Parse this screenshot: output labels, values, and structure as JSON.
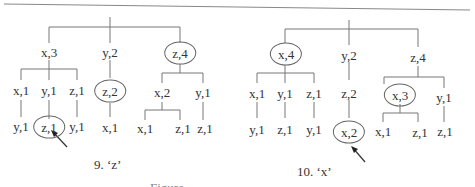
{
  "figure": {
    "caption_partial": "Figure ...",
    "panels": [
      {
        "id": "panel-9",
        "caption": "9. ‘z’",
        "root_children": [
          {
            "label": "x,3",
            "circled": false,
            "children": [
              {
                "label": "x,1",
                "children": [
                  {
                    "label": "y,1"
                  }
                ]
              },
              {
                "label": "y,1",
                "children": [
                  {
                    "label": "z,1",
                    "circled": true,
                    "arrow": true
                  }
                ]
              },
              {
                "label": "z,1",
                "children": [
                  {
                    "label": "y,1"
                  }
                ]
              }
            ]
          },
          {
            "label": "y,2",
            "circled": false,
            "children": [
              {
                "label": "z,2",
                "circled": true,
                "children": [
                  {
                    "label": "x,1"
                  }
                ]
              }
            ]
          },
          {
            "label": "z,4",
            "circled": true,
            "children": [
              {
                "label": "x,2",
                "children": [
                  {
                    "label": "x,1"
                  },
                  {
                    "label": "z,1"
                  }
                ]
              },
              {
                "label": "y,1",
                "children": [
                  {
                    "label": "z,1"
                  }
                ]
              }
            ]
          }
        ],
        "nodes": {
          "x3": "x,3",
          "y2": "y,2",
          "z4": "z,4",
          "x1a": "x,1",
          "y1a": "y,1",
          "z1a": "z,1",
          "z2": "z,2",
          "x2": "x,2",
          "y1b": "y,1",
          "y1c": "y,1",
          "z1b": "z,1",
          "y1d": "y,1",
          "x1b": "x,1",
          "x1c": "x,1",
          "z1c": "z,1",
          "z1d": "z,1"
        }
      },
      {
        "id": "panel-10",
        "caption": "10. ‘x’",
        "root_children": [
          {
            "label": "x,4",
            "circled": true,
            "children": [
              {
                "label": "x,1",
                "children": [
                  {
                    "label": "y,1"
                  }
                ]
              },
              {
                "label": "y,1",
                "children": [
                  {
                    "label": "z,1"
                  }
                ]
              },
              {
                "label": "z,1",
                "children": [
                  {
                    "label": "y,1"
                  }
                ]
              }
            ]
          },
          {
            "label": "y,2",
            "circled": false,
            "children": [
              {
                "label": "z,2",
                "children": [
                  {
                    "label": "x,2",
                    "circled": true,
                    "arrow": true
                  }
                ]
              }
            ]
          },
          {
            "label": "z,4",
            "circled": false,
            "children": [
              {
                "label": "x,3",
                "circled": true,
                "children": [
                  {
                    "label": "x,1"
                  },
                  {
                    "label": "z,1"
                  }
                ]
              },
              {
                "label": "y,1",
                "children": [
                  {
                    "label": "z,1"
                  }
                ]
              }
            ]
          }
        ],
        "nodes": {
          "x4": "x,4",
          "y2": "y,2",
          "z4": "z,4",
          "x1a": "x,1",
          "y1a": "y,1",
          "z1a": "z,1",
          "z2": "z,2",
          "x3": "x,3",
          "y1b": "y,1",
          "y1c": "y,1",
          "z1b": "z,1",
          "y1d": "y,1",
          "x2": "x,2",
          "x1c": "x,1",
          "z1c": "z,1",
          "z1d": "z,1"
        }
      }
    ]
  }
}
